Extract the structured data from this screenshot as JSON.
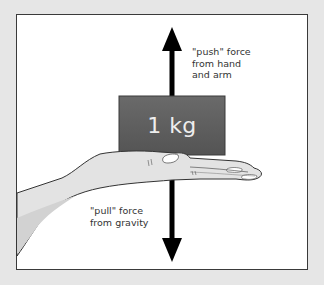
{
  "diagram": {
    "mass": {
      "label": "1 kg",
      "color": "#5c5c5c"
    },
    "push_force": {
      "label": "\"push\" force\nfrom hand\nand arm",
      "direction": "up"
    },
    "pull_force": {
      "label": "\"pull\" force\nfrom gravity",
      "direction": "down"
    },
    "colors": {
      "background": "#e6e6e6",
      "frame": "#ffffff",
      "arrow": "#000000",
      "hand_skin": "#e2e2e2",
      "hand_outline": "#333333"
    }
  }
}
